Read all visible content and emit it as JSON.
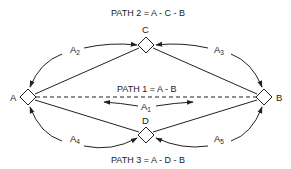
{
  "diagram": {
    "paths": [
      {
        "id": "path1",
        "label": "PATH 1 = A - B"
      },
      {
        "id": "path2",
        "label": "PATH 2 = A - C - B"
      },
      {
        "id": "path3",
        "label": "PATH 3 = A - D - B"
      }
    ],
    "nodes": [
      {
        "id": "A",
        "label": "A"
      },
      {
        "id": "B",
        "label": "B"
      },
      {
        "id": "C",
        "label": "C"
      },
      {
        "id": "D",
        "label": "D"
      }
    ],
    "arcs": [
      {
        "id": "A1",
        "base": "A",
        "sub": "1",
        "between": "A-B"
      },
      {
        "id": "A2",
        "base": "A",
        "sub": "2",
        "between": "A-C"
      },
      {
        "id": "A3",
        "base": "A",
        "sub": "3",
        "between": "C-B"
      },
      {
        "id": "A4",
        "base": "A",
        "sub": "4",
        "between": "A-D"
      },
      {
        "id": "A5",
        "base": "A",
        "sub": "5",
        "between": "D-B"
      }
    ],
    "colors": {
      "line": "#222222",
      "background": "#ffffff"
    }
  }
}
